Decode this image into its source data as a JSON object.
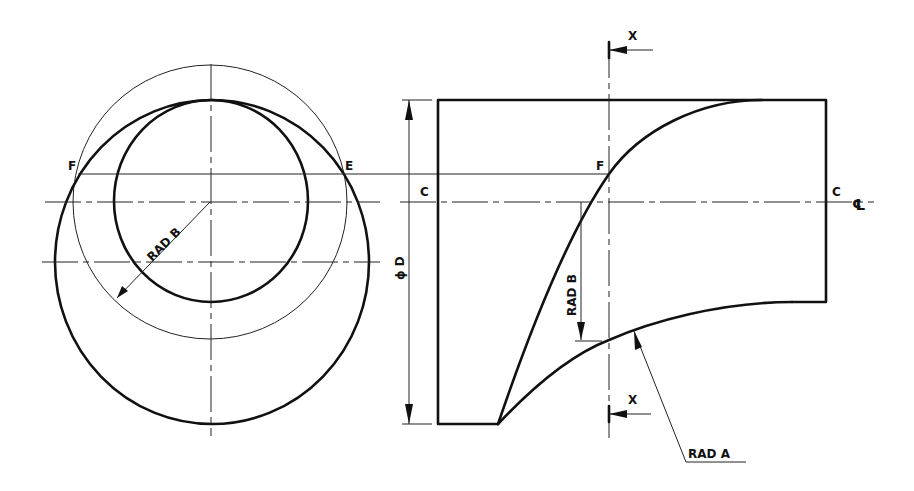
{
  "drawing": {
    "type": "orthographic engineering drawing",
    "left_view": {
      "points": [
        {
          "label": "F",
          "x": 72,
          "y": 168
        },
        {
          "label": "E",
          "x": 345,
          "y": 168
        }
      ],
      "dimension_label": "RAD B"
    },
    "right_view": {
      "labels": {
        "c_left": "C",
        "c_right": "C",
        "centerline_symbol": "℄",
        "point_f": "F",
        "section_top": "X",
        "section_bottom": "X",
        "diameter": "ϕ D",
        "rad_b": "RAD B",
        "rad_a": "RAD A"
      }
    },
    "colors": {
      "line": "#111111",
      "background": "#ffffff"
    }
  }
}
